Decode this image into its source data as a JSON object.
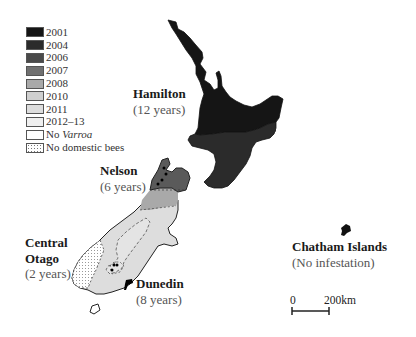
{
  "legend": {
    "items": [
      {
        "label": "2001",
        "color": "#151515",
        "pattern": "solid"
      },
      {
        "label": "2004",
        "color": "#2b2b2b",
        "pattern": "solid"
      },
      {
        "label": "2006",
        "color": "#4a4a4a",
        "pattern": "solid"
      },
      {
        "label": "2007",
        "color": "#707070",
        "pattern": "solid"
      },
      {
        "label": "2008",
        "color": "#a9a9a9",
        "pattern": "solid"
      },
      {
        "label": "2010",
        "color": "#cfcfcf",
        "pattern": "solid"
      },
      {
        "label": "2011",
        "color": "#dddddd",
        "pattern": "solid"
      },
      {
        "label": "2012–13",
        "color": "#efefef",
        "pattern": "solid"
      },
      {
        "label_prefix": "No ",
        "label_italic": "Varroa",
        "color": "#ffffff",
        "pattern": "solid"
      },
      {
        "label": "No domestic bees",
        "color": "#ffffff",
        "pattern": "dotted"
      }
    ]
  },
  "places": [
    {
      "name": "Hamilton",
      "sub": "(12 years)"
    },
    {
      "name": "Nelson",
      "sub": "(6 years)"
    },
    {
      "name": "Central Otago",
      "name_line1": "Central",
      "name_line2": "Otago",
      "sub": "(2 years)"
    },
    {
      "name": "Dunedin",
      "sub": "(8 years)"
    },
    {
      "name": "Chatham Islands",
      "sub": "(No infestation)"
    }
  ],
  "scale_bar": {
    "start_label": "0",
    "end_label": "200km"
  },
  "regions": {
    "north_upper": {
      "year": "2001"
    },
    "north_lower": {
      "year": "2004"
    },
    "nelson_tip": {
      "year": "2006"
    },
    "nelson_band": {
      "year": "2008"
    },
    "south_main": {
      "year": "2011"
    },
    "central_otago": {
      "year": "2012–13"
    },
    "fiordland": {
      "year": "No domestic bees"
    },
    "chatham": {
      "year": "2001"
    }
  }
}
